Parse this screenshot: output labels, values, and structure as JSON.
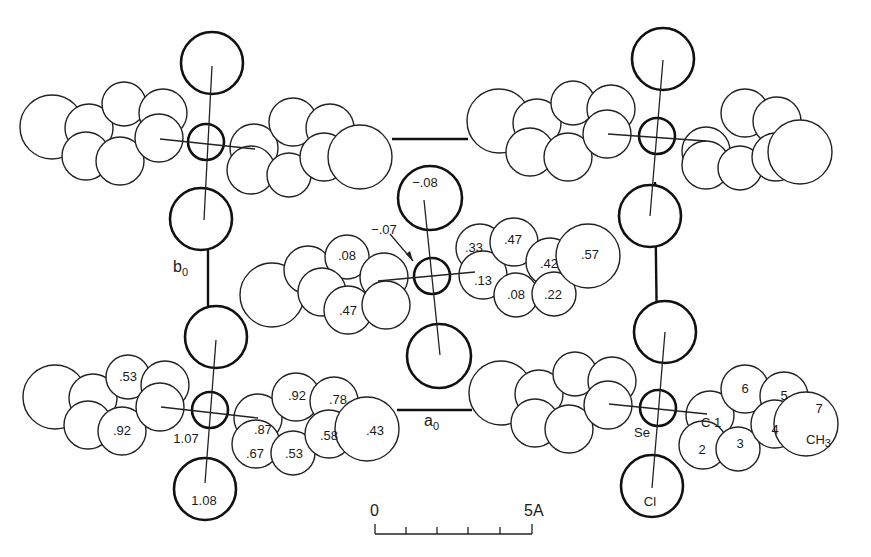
{
  "figure": {
    "type": "crystal-structure-projection",
    "colors": {
      "ink": "#1a1a1a",
      "background": "#ffffff"
    },
    "axes": {
      "a": {
        "label": "a",
        "subscript": "0"
      },
      "b": {
        "label": "b",
        "subscript": "0"
      }
    },
    "scale_bar": {
      "start_label": "0",
      "end_label": "5A",
      "ticks": 6
    },
    "atom_labels": {
      "se": "Se",
      "cl": "Cl",
      "c1": "C 1",
      "c2": "2",
      "c3": "3",
      "c4": "4",
      "c5": "5",
      "c6": "6",
      "c7": "7",
      "ch3": "CH",
      "ch3_sub": "3"
    },
    "center_molecule_heights": {
      "cl_top": "−.08",
      "se": "−.07",
      "left_ring_upper": ".08",
      "left_ring_lower": ".47",
      "right_ring_c2": ".33",
      "right_ring_c6": ".47",
      "right_ring_c1": ".13",
      "right_ring_c5": ".42",
      "right_ring_c7": ".57",
      "right_ring_c3": ".08",
      "right_ring_c4": ".22"
    },
    "lower_left_molecule_heights": {
      "left_ring_upper": ".53",
      "left_ring_lower": ".92",
      "se": "1.07",
      "cl_bottom": "1.08",
      "right_ring_c6": ".92",
      "right_ring_c5": ".78",
      "right_ring_c1": ".87",
      "right_ring_c4": ".58",
      "right_ring_c7": ".43",
      "right_ring_c2": ".67",
      "right_ring_c3": ".53"
    }
  }
}
